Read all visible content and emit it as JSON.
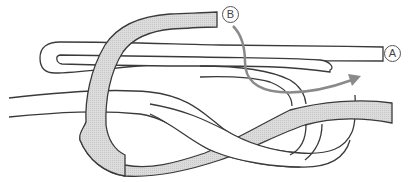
{
  "diagram": {
    "labels": {
      "end_a": "A",
      "end_b": "B"
    },
    "colors": {
      "rope_fill_shaded": "#d8d8d8",
      "rope_fill_white": "#ffffff",
      "rope_outline": "#3a3a3a",
      "arrow": "#8a8a8a",
      "label_text": "#444444"
    },
    "elements": [
      {
        "id": "standing-line",
        "description": "long white line entering from left, looping and ending at A"
      },
      {
        "id": "working-rope",
        "description": "shaded rope forming figure-eight, ending at B"
      },
      {
        "id": "direction-arrow",
        "description": "gray arrow showing where end B passes through"
      }
    ]
  }
}
